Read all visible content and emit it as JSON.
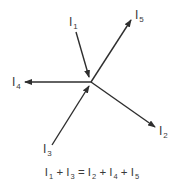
{
  "diagram": {
    "line_color": "#2e2e2e",
    "node": {
      "x": 91,
      "y": 82
    },
    "currents": [
      {
        "id": "I1",
        "letter": "I",
        "sub": "1",
        "direction": "in",
        "from": [
          76,
          32
        ],
        "to": [
          89,
          77
        ],
        "label_pos": [
          69,
          16
        ]
      },
      {
        "id": "I2",
        "letter": "I",
        "sub": "2",
        "direction": "out",
        "from": [
          91,
          82
        ],
        "to": [
          155,
          127
        ],
        "label_pos": [
          159,
          125
        ]
      },
      {
        "id": "I3",
        "letter": "I",
        "sub": "3",
        "direction": "in",
        "from": [
          52,
          145
        ],
        "to": [
          89,
          86
        ],
        "label_pos": [
          43,
          143
        ]
      },
      {
        "id": "I4",
        "letter": "I",
        "sub": "4",
        "direction": "out",
        "from": [
          91,
          82
        ],
        "to": [
          25,
          82
        ],
        "label_pos": [
          12,
          76
        ]
      },
      {
        "id": "I5",
        "letter": "I",
        "sub": "5",
        "direction": "out",
        "from": [
          91,
          82
        ],
        "to": [
          131,
          20
        ],
        "label_pos": [
          135,
          9
        ]
      }
    ],
    "equation": {
      "text": "I1 + I3 = I2 + I4 + I5",
      "terms": [
        {
          "letter": "I",
          "sub": "1"
        },
        {
          "op": "+"
        },
        {
          "letter": "I",
          "sub": "3"
        },
        {
          "op": "="
        },
        {
          "letter": "I",
          "sub": "2"
        },
        {
          "op": "+"
        },
        {
          "letter": "I",
          "sub": "4"
        },
        {
          "op": "+"
        },
        {
          "letter": "I",
          "sub": "5"
        }
      ]
    }
  }
}
